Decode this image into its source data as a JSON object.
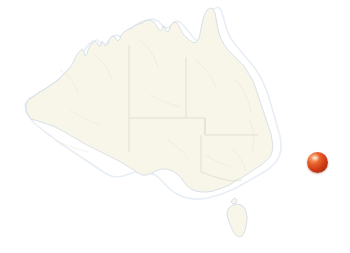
{
  "map": {
    "title": "Australia",
    "region_name": "Australia",
    "background_color": "#ffffff",
    "land_fill_color": "#f7f6e8",
    "coastline_color": "#cfd9e4",
    "state_border_color": "#d8d3c2",
    "width": 350,
    "height": 253,
    "projection_note": "",
    "landmasses": [
      {
        "name": "mainland-australia",
        "label": ""
      },
      {
        "name": "tasmania",
        "label": ""
      }
    ],
    "states_shown": [
      "Western Australia",
      "Northern Territory",
      "Queensland",
      "South Australia",
      "New South Wales",
      "Victoria",
      "Tasmania"
    ]
  },
  "marker": {
    "name": "location-marker",
    "shape": "sphere",
    "color": "#d23d18",
    "highlight_color": "#ffd9bd",
    "shadow_color": "#8e2409",
    "diameter_px": 21,
    "position": {
      "x": 307,
      "y": 152
    },
    "center": {
      "x": 317,
      "y": 162
    },
    "label": ""
  }
}
